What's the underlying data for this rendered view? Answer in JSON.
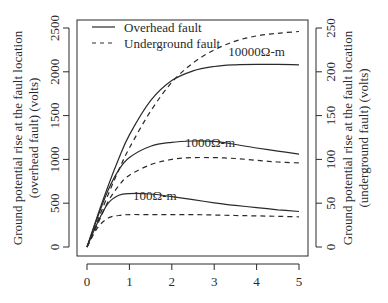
{
  "chart_data": {
    "type": "line",
    "title": "",
    "xlabel": "",
    "ylabel": "Ground potential rise at the fault location (overhead fault) (volts)",
    "ylabel_lines": [
      "Ground potential rise at the fault location",
      "(overhead fault) (volts)"
    ],
    "y2label": "Ground potential rise at the fault location (underground fault) (volts)",
    "y2label_lines": [
      "Ground potential rise at the fault location",
      "(underground fault) (volts)"
    ],
    "xlim": [
      0,
      5
    ],
    "ylim": [
      0,
      2500
    ],
    "y2lim": [
      0,
      250
    ],
    "x_ticks": [
      "0",
      "1",
      "2",
      "3",
      "4",
      "5"
    ],
    "y_ticks": [
      "0",
      "500",
      "1000",
      "1500",
      "2000",
      "2500"
    ],
    "y2_ticks": [
      "0",
      "50",
      "100",
      "150",
      "200",
      "250"
    ],
    "grid": false,
    "legend": {
      "position": "top-left",
      "entries": [
        {
          "label": "Overhead fault",
          "style": "solid"
        },
        {
          "label": "Underground fault",
          "style": "dashed"
        }
      ]
    },
    "annotations": [
      {
        "text": "10000Ω-m",
        "x": 4.0,
        "y": 2180
      },
      {
        "text": "1000Ω-m",
        "x": 2.9,
        "y": 1140
      },
      {
        "text": "100Ω-m",
        "x": 1.6,
        "y": 540
      }
    ],
    "x": [
      0,
      0.25,
      0.5,
      0.75,
      1,
      1.5,
      2,
      2.5,
      3,
      3.5,
      4,
      4.5,
      5
    ],
    "series": [
      {
        "name": "Overhead fault, 100Ω-m",
        "axis": "left",
        "style": "solid",
        "values": [
          0,
          280,
          500,
          590,
          610,
          605,
          575,
          540,
          505,
          475,
          450,
          425,
          405
        ]
      },
      {
        "name": "Overhead fault, 1000Ω-m",
        "axis": "left",
        "style": "solid",
        "values": [
          0,
          340,
          650,
          880,
          1020,
          1150,
          1195,
          1210,
          1205,
          1170,
          1130,
          1095,
          1060
        ]
      },
      {
        "name": "Overhead fault, 10000Ω-m",
        "axis": "left",
        "style": "solid",
        "values": [
          0,
          360,
          700,
          1010,
          1280,
          1670,
          1900,
          2010,
          2060,
          2080,
          2085,
          2085,
          2080
        ]
      },
      {
        "name": "Underground fault, 100Ω-m",
        "axis": "right",
        "style": "dashed",
        "values": [
          0,
          22,
          33,
          36,
          37,
          37,
          37,
          37,
          36.5,
          36,
          35.5,
          35,
          34.5
        ]
      },
      {
        "name": "Underground fault, 1000Ω-m",
        "axis": "right",
        "style": "dashed",
        "values": [
          0,
          26,
          52,
          70,
          82,
          94,
          100,
          102,
          102,
          101,
          99,
          97,
          96
        ]
      },
      {
        "name": "Underground fault, 10000Ω-m",
        "axis": "right",
        "style": "dashed",
        "values": [
          0,
          30,
          60,
          88,
          113,
          155,
          188,
          210,
          225,
          235,
          241,
          244,
          246
        ]
      }
    ]
  }
}
